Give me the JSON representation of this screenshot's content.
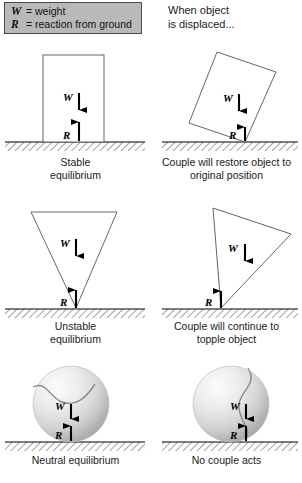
{
  "legend": {
    "rows": [
      {
        "symbol": "W",
        "equals": "=",
        "text": "weight"
      },
      {
        "symbol": "R",
        "equals": "=",
        "text": "reaction from ground"
      }
    ]
  },
  "note": {
    "line1": "When object",
    "line2": "is displaced..."
  },
  "labels": {
    "weight": "W",
    "reaction": "R"
  },
  "panels": [
    {
      "id": "stable-equilibrium",
      "shape": "upright-rectangle",
      "caption_line1": "Stable",
      "caption_line2": "equilibrium"
    },
    {
      "id": "stable-displaced",
      "shape": "tilted-rectangle",
      "caption_line1": "Couple will restore object to",
      "caption_line2": "original position"
    },
    {
      "id": "unstable-equilibrium",
      "shape": "inverted-triangle",
      "caption_line1": "Unstable",
      "caption_line2": "equilibrium"
    },
    {
      "id": "unstable-displaced",
      "shape": "tilted-inverted-triangle",
      "caption_line1": "Couple will continue to",
      "caption_line2": "topple object"
    },
    {
      "id": "neutral-equilibrium",
      "shape": "sphere",
      "caption_line1": "Neutral equilibrium",
      "caption_line2": ""
    },
    {
      "id": "neutral-displaced",
      "shape": "sphere-rotated",
      "caption_line1": "No couple acts",
      "caption_line2": ""
    }
  ],
  "colors": {
    "legend_fill": "#b9b9b9",
    "legend_border": "#4a4a4a",
    "outline": "#555555",
    "ground_line": "#000000",
    "arrow": "#000000",
    "sphere_light": "#f2f2f2",
    "sphere_dark": "#b0b0b0",
    "text": "#1a1a1a"
  }
}
